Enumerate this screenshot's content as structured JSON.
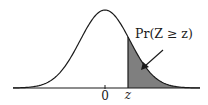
{
  "figure": {
    "type": "standard-normal-upper-tail",
    "curve": {
      "mean": 0,
      "sd": 1
    },
    "labels": {
      "mean_tick": "0",
      "z_tick": "z",
      "annotation": "Pr(Z ≥ z)"
    },
    "shaded_region": {
      "from": "z",
      "to": "+inf",
      "meaning": "upper tail probability"
    },
    "colors": {
      "curve": "#1a1a1a",
      "axis": "#1a1a1a",
      "shade": "#7f7f7f",
      "background": "#ffffff"
    }
  }
}
